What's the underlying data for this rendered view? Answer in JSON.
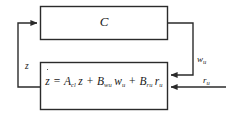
{
  "diagram": {
    "type": "control-block-diagram",
    "blocks": [
      {
        "id": "controller",
        "label": "C",
        "role": "controller",
        "x": 40,
        "y": 6,
        "w": 128,
        "h": 34
      },
      {
        "id": "plant",
        "role": "closed-loop-state-equation",
        "x": 40,
        "y": 62,
        "w": 128,
        "h": 48,
        "equation": {
          "lhs_var": "z",
          "lhs_dot": true,
          "equals": "=",
          "terms": [
            {
              "coefficient": "A",
              "coefficient_sub": "cl",
              "variable": "z",
              "variable_sub": ""
            },
            {
              "coefficient": "B",
              "coefficient_sub": "wu",
              "variable": "w",
              "variable_sub": "u"
            },
            {
              "coefficient": "B",
              "coefficient_sub": "ru",
              "variable": "r",
              "variable_sub": "u"
            }
          ],
          "plus": "+",
          "plain_text": "ż = A_cl z + B_wu w_u + B_ru r_u"
        }
      }
    ],
    "signals": [
      {
        "id": "z",
        "label": "z",
        "label_sub": "",
        "from": "plant",
        "to": "controller",
        "path": "feedback-left"
      },
      {
        "id": "wu",
        "label": "w",
        "label_sub": "u",
        "from": "controller",
        "to": "plant",
        "path": "forward-right"
      },
      {
        "id": "ru",
        "label": "r",
        "label_sub": "u",
        "from": "external",
        "to": "plant",
        "path": "external-input-right"
      }
    ],
    "colors": {
      "stroke": "#2b2b2b",
      "text": "#1a1a1a",
      "background": "#ffffff"
    }
  }
}
